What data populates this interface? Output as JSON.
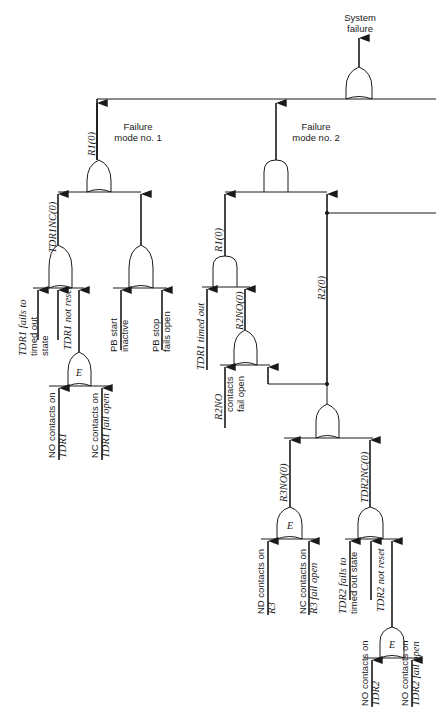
{
  "diagram": {
    "type": "fault-tree",
    "top_event": {
      "label_line1": "System",
      "label_line2": "failure",
      "gate": "OR"
    },
    "failure_modes": [
      {
        "id": "fm1",
        "label_line1": "Failure",
        "label_line2": "mode no. 1",
        "gate": "OR",
        "output": "R1(0)"
      },
      {
        "id": "fm2",
        "label_line1": "Failure",
        "label_line2": "mode no. 2",
        "gate": "AND"
      }
    ],
    "signals": {
      "fm1_out": "R1(0)",
      "tdr1nc": "TDR1NC(0)",
      "fm2_r1": "R1(0)",
      "r2no": "R2NO(0)",
      "r2": "R2(0)",
      "r3no": "R3NO(0)",
      "tdr2nc": "TDR2NC(0)"
    },
    "gates": {
      "e_gate_label": "E"
    },
    "basic_events": {
      "tdr1_fails_timed_out": [
        "TDR1 fails to",
        "timed out",
        "state"
      ],
      "tdr1_not_reset": "TDR1 not reset",
      "pb_start_inactive": [
        "PB start",
        "inactive"
      ],
      "pb_stop_fails_open": [
        "PB stop",
        "fails open"
      ],
      "no_contacts_tdr1": [
        "NO contacts on",
        "TDR1"
      ],
      "nc_contacts_tdr1": [
        "NC contacts on",
        "TDR1 fail open"
      ],
      "tdr1_timed_out": "TDR1 timed out",
      "r2no_contacts_fail_open": [
        "R2NO",
        "contacts",
        "fail open"
      ],
      "no_contacts_r3": [
        "ND contacts on",
        "R3"
      ],
      "nc_contacts_r3": [
        "NC contacts on",
        "R3 fail open"
      ],
      "tdr2_fails_timed_out": [
        "TDR2 fails to",
        "timed out state"
      ],
      "tdr2_not_reset": "TDR2 not reset",
      "no_contacts_tdr2": [
        "NO contacts on",
        "TDR2"
      ],
      "no_contacts_tdr2_fail": [
        "NO contacts on",
        "TDR2 fail open"
      ]
    },
    "colors": {
      "line": "#1a1a1a",
      "background": "#ffffff"
    }
  }
}
